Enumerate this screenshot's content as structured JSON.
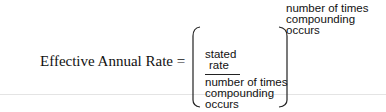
{
  "formula": {
    "lhs": "Effective Annual Rate =",
    "numerator": [
      "stated",
      "rate"
    ],
    "denominator": [
      "number of times",
      "compounding",
      "occurs"
    ],
    "exponent": [
      "number of times",
      "compounding",
      "occurs"
    ]
  }
}
